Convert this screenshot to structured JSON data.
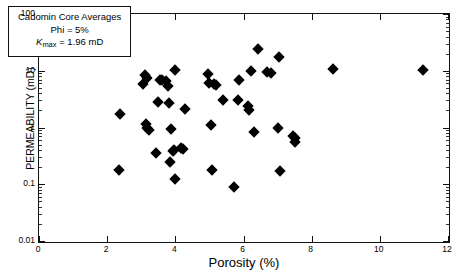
{
  "chart_data": {
    "type": "scatter",
    "title": "",
    "xlabel": "Porosity (%)",
    "ylabel": "PERMEABILITY (mD)",
    "xlim": [
      0,
      12
    ],
    "ylim": [
      0.01,
      100
    ],
    "yscale": "log",
    "xscale": "linear",
    "grid": false,
    "legend_position": "top-left",
    "xticks": [
      "0",
      "2",
      "4",
      "6",
      "8",
      "10",
      "12"
    ],
    "xtick_values": [
      0,
      2,
      4,
      6,
      8,
      10,
      12
    ],
    "yticks": [
      "0.01",
      "0.1",
      "1",
      "10",
      "100"
    ],
    "ytick_values": [
      0.01,
      0.1,
      1,
      10,
      100
    ],
    "series": [
      {
        "name": "Cadomin core averages",
        "marker": "diamond",
        "color": "#000000",
        "points": [
          [
            2.38,
            1.75
          ],
          [
            2.35,
            0.175
          ],
          [
            3.05,
            5.9
          ],
          [
            3.12,
            8.3
          ],
          [
            3.18,
            7.6
          ],
          [
            3.15,
            1.15
          ],
          [
            3.18,
            0.98
          ],
          [
            3.22,
            0.92
          ],
          [
            3.42,
            0.35
          ],
          [
            3.5,
            2.8
          ],
          [
            3.55,
            7.0
          ],
          [
            3.62,
            6.8
          ],
          [
            3.72,
            6.5
          ],
          [
            3.78,
            5.4
          ],
          [
            3.8,
            2.65
          ],
          [
            3.85,
            0.25
          ],
          [
            3.88,
            0.96
          ],
          [
            3.92,
            0.38
          ],
          [
            3.97,
            0.4
          ],
          [
            3.98,
            10.3
          ],
          [
            4.0,
            0.122
          ],
          [
            4.18,
            0.43
          ],
          [
            4.22,
            0.42
          ],
          [
            4.28,
            2.1
          ],
          [
            4.95,
            8.8
          ],
          [
            4.98,
            6.2
          ],
          [
            5.05,
            1.1
          ],
          [
            5.08,
            0.175
          ],
          [
            5.12,
            5.8
          ],
          [
            5.18,
            5.7
          ],
          [
            5.4,
            3.0
          ],
          [
            5.72,
            0.089
          ],
          [
            5.85,
            3.0
          ],
          [
            5.88,
            6.9
          ],
          [
            6.12,
            2.35
          ],
          [
            6.15,
            2.05
          ],
          [
            6.22,
            9.9
          ],
          [
            6.3,
            0.82
          ],
          [
            6.42,
            24.0
          ],
          [
            6.68,
            9.4
          ],
          [
            6.82,
            9.3
          ],
          [
            7.02,
            0.99
          ],
          [
            7.05,
            17.5
          ],
          [
            7.08,
            0.17
          ],
          [
            7.45,
            0.72
          ],
          [
            7.5,
            0.66
          ],
          [
            7.52,
            0.56
          ],
          [
            8.62,
            10.8
          ],
          [
            11.28,
            10.3
          ]
        ]
      }
    ],
    "annotations": [
      {
        "name": "legend-box",
        "lines": [
          "Cadomin Core Averages",
          "Phi = 5%",
          "Kmax = 1.96 mD"
        ]
      }
    ]
  },
  "legend": {
    "title": "Cadomin Core Averages",
    "phi_line": "Phi = 5%",
    "kmax_symbol": "K",
    "kmax_subscript": "max",
    "kmax_value": " = 1.96 mD"
  },
  "axes": {
    "x_title": "Porosity (%)",
    "y_title": "PERMEABILITY (mD)",
    "x_ticks": [
      "0",
      "2",
      "4",
      "6",
      "8",
      "10",
      "12"
    ],
    "y_ticks": [
      "100",
      "10",
      "1",
      "0.1",
      "0.01"
    ]
  }
}
